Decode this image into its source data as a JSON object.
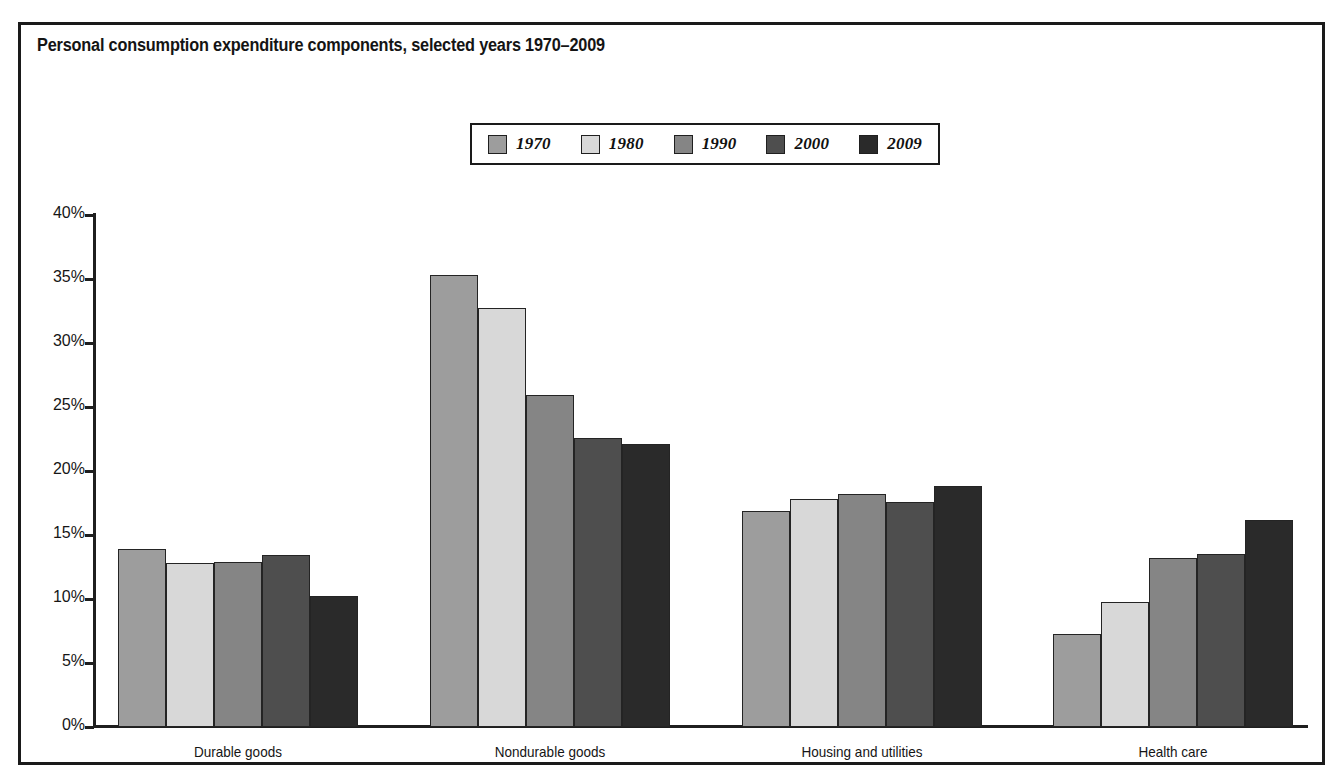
{
  "chart_data": {
    "type": "bar",
    "title": "Personal consumption expenditure components, selected years 1970–2009",
    "xlabel": "",
    "ylabel": "",
    "ylim": [
      0,
      40
    ],
    "ytick_labels": [
      "0%",
      "5%",
      "10%",
      "15%",
      "20%",
      "25%",
      "30%",
      "35%",
      "40%"
    ],
    "ytick_values": [
      0,
      5,
      10,
      15,
      20,
      25,
      30,
      35,
      40
    ],
    "grid": false,
    "legend_position": "top-center",
    "categories": [
      "Durable goods",
      "Nondurable goods",
      "Housing and utilities",
      "Health care"
    ],
    "series": [
      {
        "name": "1970",
        "color": "#9d9d9d",
        "values": [
          13.9,
          35.3,
          16.9,
          7.3
        ]
      },
      {
        "name": "1980",
        "color": "#d8d8d8",
        "values": [
          12.8,
          32.7,
          17.8,
          9.8
        ]
      },
      {
        "name": "1990",
        "color": "#858585",
        "values": [
          12.9,
          25.9,
          18.2,
          13.2
        ]
      },
      {
        "name": "2000",
        "color": "#4e4e4e",
        "values": [
          13.4,
          22.6,
          17.6,
          13.5
        ]
      },
      {
        "name": "2009",
        "color": "#2a2a2a",
        "values": [
          10.2,
          22.1,
          18.8,
          16.2
        ]
      }
    ]
  },
  "colors": {
    "frame": "#1a1a1a",
    "axis": "#1f1f1f",
    "text": "#141414",
    "background": "#ffffff"
  }
}
